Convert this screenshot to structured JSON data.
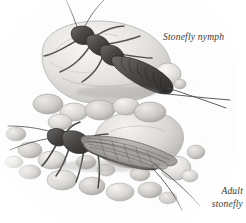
{
  "illustration": {
    "title": "Stonefly nymph and adult stonefly on streambed rocks",
    "medium": "pencil / graphite scientific illustration",
    "background_color": "#ffffff",
    "ink_color": "#3a3a3a",
    "rock_light": "#f2f1ef",
    "rock_mid": "#cfcecb",
    "rock_dark": "#9a9997",
    "subjects": [
      {
        "id": "nymph",
        "name": "Stonefly nymph",
        "position": "upper-left, resting on a large boulder",
        "features": [
          "two long antennae",
          "segmented abdomen",
          "six legs",
          "two long cerci (tails)"
        ]
      },
      {
        "id": "adult",
        "name": "Adult stonefly",
        "position": "lower-left-center, standing on cobbles",
        "features": [
          "folded veined wings",
          "two long antennae",
          "six legs",
          "two cerci"
        ]
      }
    ]
  },
  "labels": {
    "nymph": "Stonefly nymph",
    "adult_line1": "Adult",
    "adult_line2": "stonefly"
  }
}
